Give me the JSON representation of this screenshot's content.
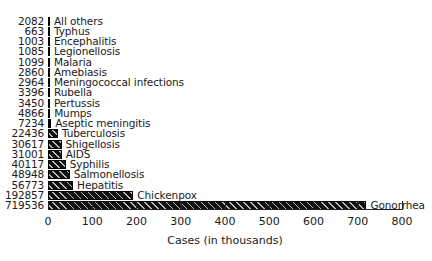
{
  "chart_data": {
    "type": "bar",
    "orientation": "horizontal",
    "title": "",
    "xlabel": "Cases (in thousands)",
    "ylabel": "",
    "xlim": [
      0,
      800
    ],
    "xticks": [
      "0",
      "100",
      "200",
      "300",
      "400",
      "500",
      "600",
      "700",
      "800"
    ],
    "grid": false,
    "legend": null,
    "categories": [
      "All others",
      "Typhus",
      "Encephalitis",
      "Legionellosis",
      "Malaria",
      "Amebiasis",
      "Meningococcal infections",
      "Rubella",
      "Pertussis",
      "Mumps",
      "Aseptic meningitis",
      "Tuberculosis",
      "Shigellosis",
      "AIDS",
      "Syphilis",
      "Salmonellosis",
      "Hepatitis",
      "Chickenpox",
      "Gonorrhea"
    ],
    "values": [
      2082,
      663,
      1003,
      1085,
      1099,
      2860,
      2964,
      3396,
      3450,
      4866,
      7234,
      22436,
      30617,
      31001,
      40117,
      48948,
      56773,
      192857,
      719536
    ],
    "value_labels": [
      "2082",
      "663",
      "1003",
      "1085",
      "1099",
      "2860",
      "2964",
      "3396",
      "3450",
      "4866",
      "7234",
      "22436",
      "30617",
      "31001",
      "40117",
      "48948",
      "56773",
      "192857",
      "719536"
    ],
    "bar_style": "black with diagonal hatching"
  }
}
